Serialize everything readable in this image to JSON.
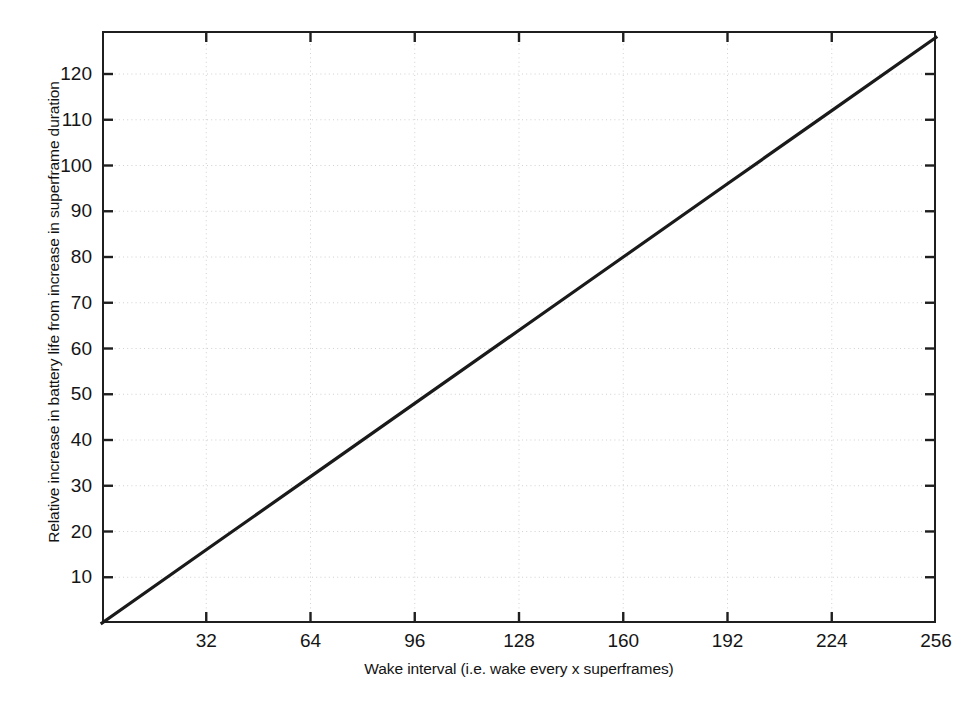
{
  "chart_data": {
    "type": "line",
    "title": "",
    "xlabel": "Wake interval (i.e. wake every x superframes)",
    "ylabel": "Relative increase in battery life from increase in superframe duration",
    "xlim": [
      0,
      256
    ],
    "ylim": [
      0,
      129.4
    ],
    "xticks": [
      32,
      64,
      96,
      128,
      160,
      192,
      224,
      256
    ],
    "xtick_labels": [
      "32",
      "64",
      "96",
      "128",
      "160",
      "192",
      "224",
      "256"
    ],
    "yticks": [
      10,
      20,
      30,
      40,
      50,
      60,
      70,
      80,
      90,
      100,
      110,
      120
    ],
    "ytick_labels": [
      "120",
      "110",
      "100",
      "90",
      "80",
      "70",
      "60",
      "50",
      "40",
      "30",
      "20",
      "10"
    ],
    "grid": true,
    "grid_style": "dotted",
    "grid_color": "#cfcfcf",
    "legend": null,
    "line_color": "#1a1a1a",
    "line_width": 3.2,
    "series": [
      {
        "name": "Relative battery life increase",
        "x": [
          0,
          32,
          64,
          96,
          128,
          160,
          192,
          224,
          256
        ],
        "y": [
          0,
          16,
          32,
          48,
          64,
          80,
          96,
          112,
          128
        ]
      }
    ],
    "annotations": []
  },
  "figure": {
    "background": "#ffffff",
    "axis_color": "#1f1f1f",
    "text_color": "#151515"
  }
}
